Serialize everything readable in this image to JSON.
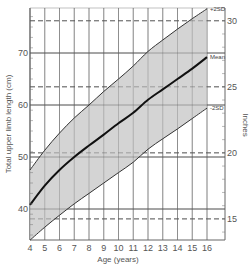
{
  "chart_data": {
    "type": "area",
    "title": "",
    "xlabel": "Age (years)",
    "ylabel": "Total upper limb length (cm)",
    "y2label": "Inches",
    "xlim": [
      4,
      16
    ],
    "ylim": [
      34,
      78.7
    ],
    "x_ticks": [
      4,
      5,
      6,
      7,
      8,
      9,
      10,
      11,
      12,
      13,
      14,
      15,
      16
    ],
    "y_ticks": [
      40,
      50,
      60,
      70
    ],
    "y2_ticks": [
      15,
      20,
      25,
      30
    ],
    "grid": true,
    "x": [
      4,
      5,
      6,
      7,
      8,
      9,
      10,
      11,
      12,
      13,
      14,
      15,
      16
    ],
    "series": [
      {
        "name": "+2SD",
        "values": [
          47.5,
          51.3,
          54.6,
          57.5,
          60.0,
          62.6,
          65.0,
          67.5,
          70.3,
          72.5,
          74.6,
          76.6,
          78.5
        ]
      },
      {
        "name": "Mean",
        "values": [
          40.8,
          44.5,
          47.5,
          50.0,
          52.2,
          54.3,
          56.5,
          58.5,
          61.0,
          63.0,
          65.0,
          67.0,
          69.2
        ]
      },
      {
        "name": "-2SD",
        "values": [
          34.0,
          36.5,
          38.8,
          41.0,
          43.0,
          45.0,
          47.0,
          49.0,
          51.5,
          53.5,
          55.4,
          57.4,
          59.4
        ]
      }
    ],
    "series_labels": [
      "+2SD",
      "Mean",
      "-2SD"
    ]
  }
}
